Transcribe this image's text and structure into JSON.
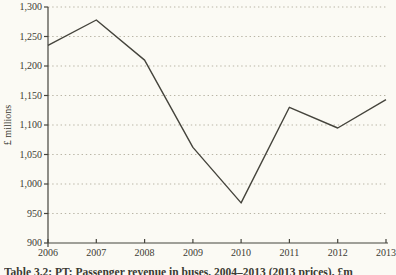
{
  "page": {
    "background": "#fbfaf4"
  },
  "chart_data": {
    "type": "line",
    "x": [
      "2006",
      "2007",
      "2008",
      "2009",
      "2010",
      "2011",
      "2012",
      "2013"
    ],
    "series": [
      {
        "name": "passenger-revenue",
        "values": [
          1235,
          1278,
          1210,
          1062,
          968,
          1130,
          1095,
          1143
        ]
      }
    ],
    "title": "",
    "xlabel": "",
    "ylabel": "£ millions",
    "ylim": [
      900,
      1300
    ],
    "yticks": [
      900,
      950,
      1000,
      1050,
      1100,
      1150,
      1200,
      1250,
      1300
    ],
    "ytick_labels": [
      "900",
      "950",
      "1,000",
      "1,050",
      "1,100",
      "1,150",
      "1,200",
      "1,250",
      "1,300"
    ],
    "grid": "horizontal-dotted",
    "legend": "none",
    "line_color": "#45443c",
    "grid_color": "#b9b5a6",
    "axis_color": "#45443c",
    "text_color": "#3b3a33"
  },
  "caption": {
    "text": "Table 3.2: PT: Passenger revenue in buses, 2004–2013 (2013 prices), £m"
  }
}
